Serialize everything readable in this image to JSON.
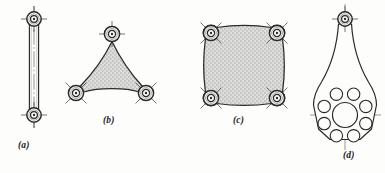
{
  "figure": {
    "background_color": "#fdfdfc",
    "line_color": "#2a2a2a",
    "fill_color": "#d8d8d6",
    "stipple_color": "#8d8d8a",
    "centerline_color": "#4a4a4a"
  },
  "captions": {
    "a": "(a)",
    "b": "(b)",
    "c": "(c)",
    "d": "(d)"
  },
  "parts": [
    {
      "id": "a",
      "label": "(a)",
      "name": "binary-link",
      "joint_count": 2,
      "description": "Straight two-force binary link with a revolute joint at each end",
      "filled": false,
      "joints": [
        {
          "cx": 34,
          "cy": 19,
          "outer_r": 7.2,
          "inner_r": 3.4,
          "hub_r": 1.2,
          "cross": "plus"
        },
        {
          "cx": 34,
          "cy": 115,
          "outer_r": 7.2,
          "inner_r": 3.4,
          "hub_r": 1.2,
          "cross": "plus"
        }
      ]
    },
    {
      "id": "b",
      "label": "(b)",
      "name": "ternary-link",
      "joint_count": 3,
      "description": "Triangular ternary link with three revolute joints and concave sides",
      "filled": true,
      "joints": [
        {
          "cx": 112,
          "cy": 34,
          "outer_r": 7.6,
          "inner_r": 3.6,
          "hub_r": 1.2,
          "cross": "plus"
        },
        {
          "cx": 76,
          "cy": 93,
          "outer_r": 7.6,
          "inner_r": 3.6,
          "hub_r": 1.2,
          "cross": "x"
        },
        {
          "cx": 146,
          "cy": 93,
          "outer_r": 7.6,
          "inner_r": 3.6,
          "hub_r": 1.2,
          "cross": "x"
        }
      ]
    },
    {
      "id": "c",
      "label": "(c)",
      "name": "quaternary-link",
      "joint_count": 4,
      "description": "Square quaternary link with four revolute joints at the corners",
      "filled": true,
      "joints": [
        {
          "cx": 211,
          "cy": 33,
          "outer_r": 7.6,
          "inner_r": 3.6,
          "hub_r": 1.2,
          "cross": "x"
        },
        {
          "cx": 277,
          "cy": 33,
          "outer_r": 7.6,
          "inner_r": 3.6,
          "hub_r": 1.2,
          "cross": "x"
        },
        {
          "cx": 211,
          "cy": 98,
          "outer_r": 7.6,
          "inner_r": 3.6,
          "hub_r": 1.2,
          "cross": "x"
        },
        {
          "cx": 277,
          "cy": 98,
          "outer_r": 7.6,
          "inner_r": 3.6,
          "hub_r": 1.2,
          "cross": "x"
        }
      ]
    },
    {
      "id": "d",
      "label": "(d)",
      "name": "flanged-crank-link",
      "joint_count": 1,
      "bolt_hole_count": 8,
      "description": "Tapered crank link with a pin joint at the small end and a bolt circle of eight holes around a central bore at the flange end",
      "filled": false,
      "joints": [
        {
          "cx": 345,
          "cy": 19,
          "outer_r": 7.2,
          "inner_r": 3.4,
          "hub_r": 1.2,
          "cross": "plus"
        }
      ],
      "central_bore": {
        "cx": 345,
        "cy": 115,
        "r": 12.5
      },
      "bolt_circle": {
        "cx": 345,
        "cy": 115,
        "radius": 22.5,
        "hole_r": 6.2,
        "count": 8,
        "start_angle": 22.5
      }
    }
  ]
}
